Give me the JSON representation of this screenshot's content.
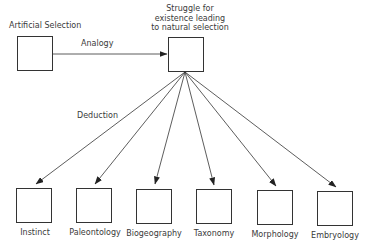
{
  "diagram": {
    "source": {
      "label": "Artificial Selection"
    },
    "target": {
      "label_lines": [
        "Struggle for",
        "existence leading",
        "to natural selection"
      ]
    },
    "edge_analogy": {
      "label": "Analogy"
    },
    "edge_deduction": {
      "label": "Deduction"
    },
    "children": [
      {
        "label": "Instinct"
      },
      {
        "label": "Paleontology"
      },
      {
        "label": "Biogeography"
      },
      {
        "label": "Taxonomy"
      },
      {
        "label": "Morphology"
      },
      {
        "label": "Embryology"
      }
    ],
    "colors": {
      "line": "#333333",
      "text": "#3a3a3a",
      "background": "#ffffff"
    }
  }
}
